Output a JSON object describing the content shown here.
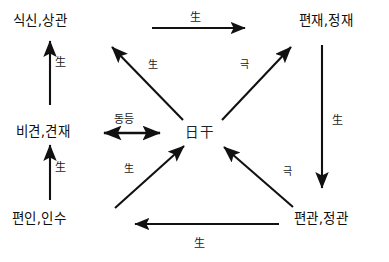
{
  "diagram": {
    "background_color": "#ffffff",
    "stroke_color": "#111111",
    "nodes": {
      "top_left": "식신,상관",
      "top_right": "편재,정재",
      "middle_left": "비견,견재",
      "bottom_left": "편인,인수",
      "bottom_right": "편관,정관",
      "center": "日干"
    },
    "edges": {
      "top_horizontal": {
        "label": "生",
        "from": "식신,상관",
        "to": "편재,정재",
        "direction": "right"
      },
      "left_upper_vertical": {
        "label": "生",
        "from": "비견,견재",
        "to": "식신,상관",
        "direction": "up"
      },
      "left_lower_vertical": {
        "label": "生",
        "from": "편인,인수",
        "to": "비견,견재",
        "direction": "up"
      },
      "right_vertical": {
        "label": "生",
        "from": "편재,정재",
        "to": "편관,정관",
        "direction": "down"
      },
      "bottom_horizontal": {
        "label": "生",
        "from": "편관,정관",
        "to": "편인,인수",
        "direction": "left"
      },
      "center_to_top_left": {
        "label": "生",
        "from": "日干",
        "to": "식신,상관",
        "direction": "up-left"
      },
      "center_to_top_right": {
        "label": "극",
        "from": "日干",
        "to": "편재,정재",
        "direction": "up-right"
      },
      "bottom_left_to_center": {
        "label": "生",
        "from": "편인,인수",
        "to": "日干",
        "direction": "up-right"
      },
      "bottom_right_to_center": {
        "label": "극",
        "from": "편관,정관",
        "to": "日干",
        "direction": "up-left"
      },
      "middle_left_center": {
        "label": "동등",
        "from": "비견,견재",
        "to": "日干",
        "direction": "both"
      }
    }
  }
}
